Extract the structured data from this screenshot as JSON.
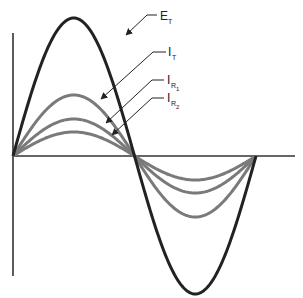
{
  "diagram": {
    "axes": {
      "origin": [
        13,
        156
      ],
      "y_axis": {
        "top": 33,
        "bottom": 276
      },
      "x_axis": {
        "right": 295
      },
      "zero_crossings_x": [
        13,
        134,
        256
      ]
    },
    "curves": [
      {
        "id": "ET",
        "label_main": "E",
        "label_sub": "T",
        "amplitude_px": 138,
        "color": "#222222",
        "width": 3
      },
      {
        "id": "IT",
        "label_main": "I",
        "label_sub": "T",
        "amplitude_px": 61,
        "color": "#7a7a7a",
        "width": 3
      },
      {
        "id": "IR1",
        "label_main": "I",
        "label_sub": "R",
        "label_subsub": "1",
        "amplitude_px": 37,
        "color": "#7a7a7a",
        "width": 3
      },
      {
        "id": "IR2",
        "label_main": "I",
        "label_sub": "R",
        "label_subsub": "2",
        "amplitude_px": 24,
        "color": "#7a7a7a",
        "width": 3
      }
    ],
    "labels": {
      "ET": {
        "main": "E",
        "sub": "T"
      },
      "IT": {
        "main": "I",
        "sub": "T"
      },
      "IR1": {
        "main": "I",
        "sub": "R",
        "subsub": "1"
      },
      "IR2": {
        "main": "I",
        "sub": "R",
        "subsub": "2"
      }
    }
  }
}
